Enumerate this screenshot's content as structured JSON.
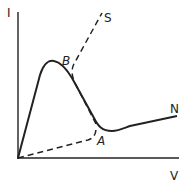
{
  "diagram": {
    "axes": {
      "y_label": "I",
      "x_label": "V"
    },
    "points": {
      "B": "B",
      "A": "A",
      "S": "S",
      "N": "N"
    },
    "colors": {
      "stroke": "#222222",
      "background": "#ffffff"
    }
  }
}
